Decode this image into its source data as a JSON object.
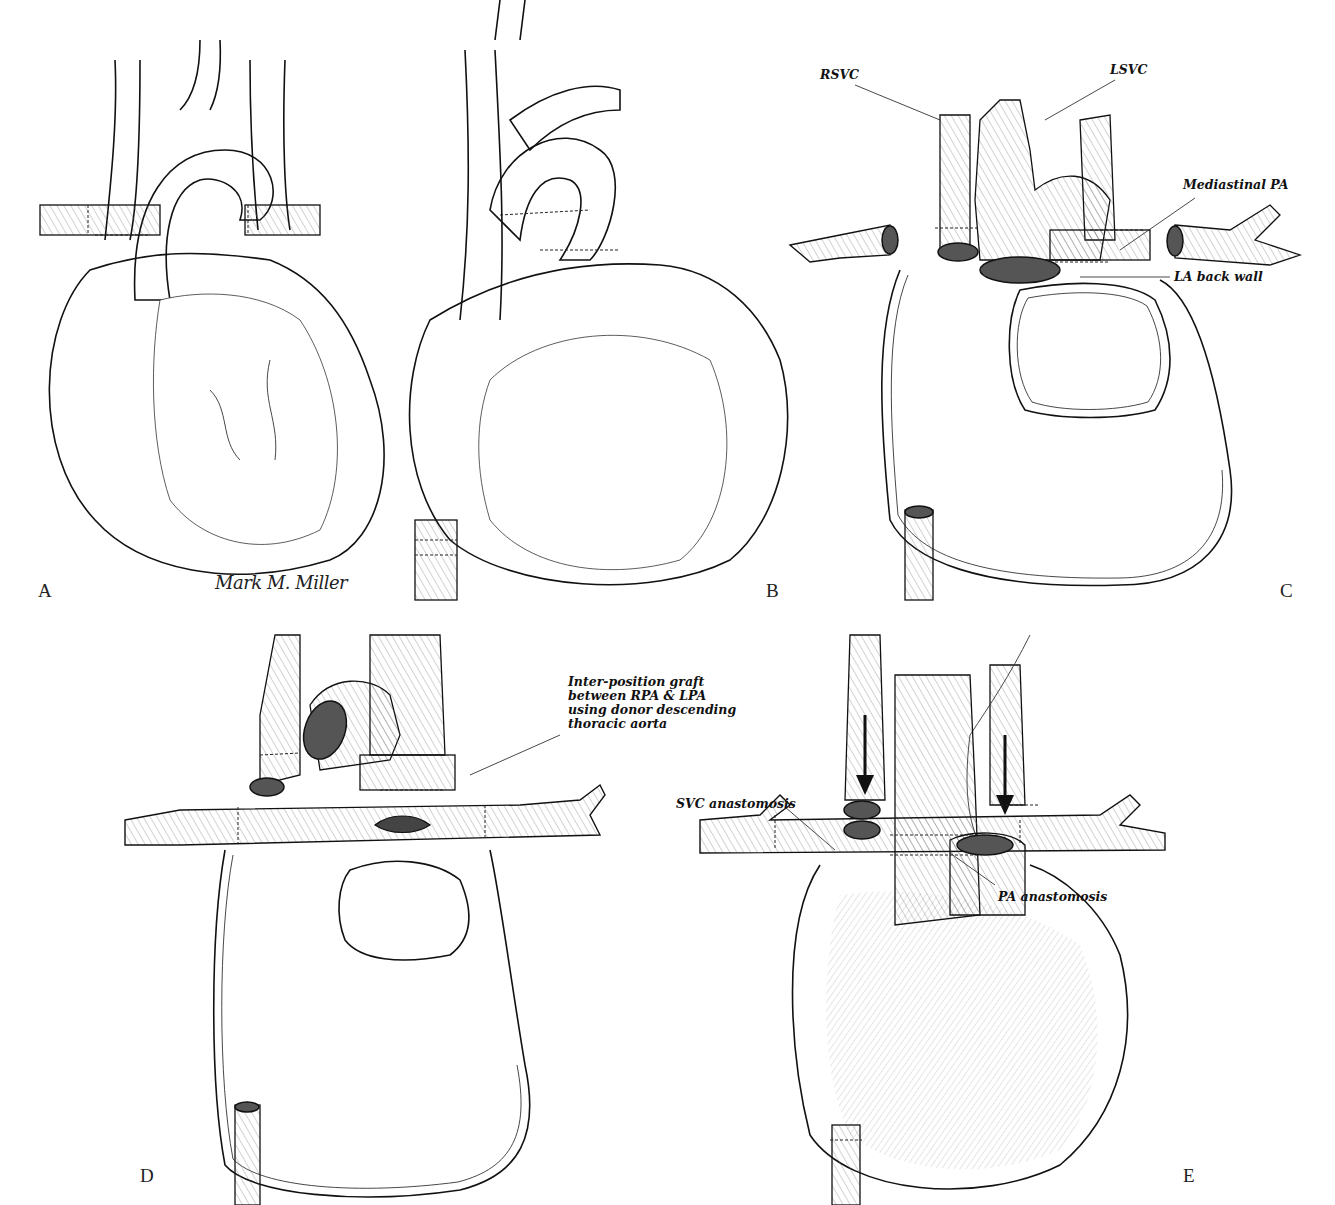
{
  "figure": {
    "signature": "Mark M. Miller",
    "panels": [
      {
        "id": "A",
        "letter": "A"
      },
      {
        "id": "B",
        "letter": "B"
      },
      {
        "id": "C",
        "letter": "C",
        "labels": {
          "rsvc": "RSVC",
          "lsvc": "LSVC",
          "mediastinal_pa": "Mediastinal PA",
          "la_back_wall": "LA back wall"
        }
      },
      {
        "id": "D",
        "letter": "D",
        "labels": {
          "graft": "Inter-position graft between RPA & LPA using donor descending thoracic aorta"
        }
      },
      {
        "id": "E",
        "letter": "E",
        "labels": {
          "svc_anastomosis": "SVC anastomosis",
          "pa_anastomosis": "PA anastomosis"
        }
      }
    ]
  },
  "colors": {
    "line": "#111111",
    "background": "#ffffff",
    "lumen": "#555555"
  }
}
